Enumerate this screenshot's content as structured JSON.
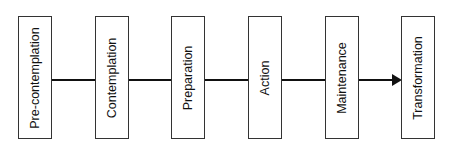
{
  "diagram": {
    "type": "flow",
    "direction": "left-to-right",
    "stages": [
      {
        "label": "Pre-contemplation"
      },
      {
        "label": "Contemplation"
      },
      {
        "label": "Preparation"
      },
      {
        "label": "Action"
      },
      {
        "label": "Maintenance"
      },
      {
        "label": "Transformation"
      }
    ],
    "connector_color": "#111111",
    "box_border_color": "#333333"
  }
}
